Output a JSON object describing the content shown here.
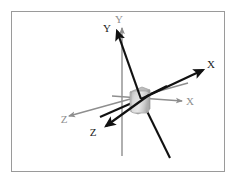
{
  "figure": {
    "background_color": "#ffffff",
    "border_color": "#9a9a9a",
    "border": {
      "x": 11,
      "y": 11,
      "width": 214,
      "height": 161
    }
  },
  "frames": [
    {
      "id": "reference-frame",
      "name": "gray-reference-frame",
      "color": "#8e8e8e",
      "stroke_width": 1.3,
      "origin": {
        "x": 141,
        "y": 99
      },
      "axes": [
        {
          "name": "y-axis",
          "label": "Y",
          "label_pos": {
            "x": 124,
            "y": 22
          },
          "start": {
            "x": 122,
            "y": 156
          },
          "end": {
            "x": 122,
            "y": 28
          },
          "arrow": true
        },
        {
          "name": "x-axis",
          "label": "X",
          "label_pos": {
            "x": 188,
            "y": 105
          },
          "start": {
            "x": 141,
            "y": 99
          },
          "end": {
            "x": 182,
            "y": 101
          },
          "arrow": true
        },
        {
          "name": "z-axis",
          "label": "Z",
          "label_pos": {
            "x": 64,
            "y": 123
          },
          "start": {
            "x": 188,
            "y": 83
          },
          "end": {
            "x": 69,
            "y": 116
          },
          "arrow": true
        }
      ]
    },
    {
      "id": "body-frame",
      "name": "black-body-frame",
      "color": "#111111",
      "stroke_width": 2.2,
      "origin": {
        "x": 141,
        "y": 99
      },
      "axes": [
        {
          "name": "y-axis",
          "label": "Y",
          "label_pos": {
            "x": 106,
            "y": 30
          },
          "start": {
            "x": 170,
            "y": 158
          },
          "end": {
            "x": 117,
            "y": 31
          },
          "arrow": true
        },
        {
          "name": "x-axis",
          "label": "X",
          "label_pos": {
            "x": 209,
            "y": 68
          },
          "start": {
            "x": 100,
            "y": 117
          },
          "end": {
            "x": 203,
            "y": 70
          },
          "arrow": true
        },
        {
          "name": "z-axis",
          "label": "Z",
          "label_pos": {
            "x": 92,
            "y": 136
          },
          "start": {
            "x": 167,
            "y": 86
          },
          "end": {
            "x": 106,
            "y": 126
          },
          "arrow": true
        }
      ]
    }
  ],
  "body": {
    "name": "rigid-body-block",
    "center": {
      "x": 139,
      "y": 100
    },
    "width": 19,
    "height": 25,
    "fill_light": "#e6e6e6",
    "fill_mid": "#c9c9c9",
    "fill_dark": "#a8a8a8",
    "outline": "#9b9b9b"
  }
}
